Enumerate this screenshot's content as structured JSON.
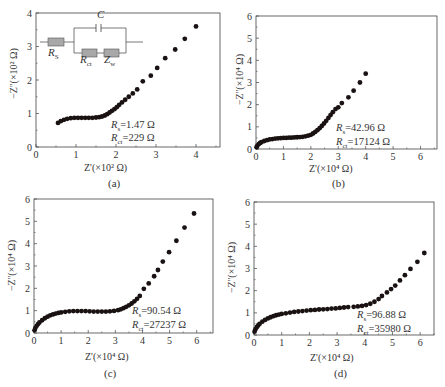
{
  "chart_data": [
    {
      "id": "a",
      "type": "scatter",
      "caption": "(a)",
      "xlabel": "Z'(×10² Ω)",
      "ylabel": "−Z''(×10² Ω)",
      "xlim": [
        0,
        4.6
      ],
      "ylim": [
        0,
        4
      ],
      "xticks": [
        0,
        1,
        2,
        3,
        4
      ],
      "yticks": [
        0,
        1,
        2,
        3,
        4
      ],
      "annotations": [
        "Rs=1.47 Ω",
        "Rct=229 Ω"
      ],
      "inset": {
        "type": "equivalent-circuit",
        "labels": [
          "C",
          "RS",
          "Rct",
          "Zw"
        ]
      },
      "x": [
        0.55,
        0.62,
        0.7,
        0.78,
        0.87,
        0.96,
        1.05,
        1.14,
        1.23,
        1.32,
        1.41,
        1.5,
        1.58,
        1.65,
        1.72,
        1.78,
        1.84,
        1.9,
        1.96,
        2.02,
        2.08,
        2.15,
        2.23,
        2.32,
        2.42,
        2.53,
        2.67,
        2.87,
        3.03,
        3.23,
        3.48,
        3.72,
        4.0,
        4.33
      ],
      "y": [
        0.72,
        0.77,
        0.81,
        0.84,
        0.86,
        0.87,
        0.87,
        0.87,
        0.87,
        0.87,
        0.87,
        0.88,
        0.89,
        0.91,
        0.94,
        0.98,
        1.03,
        1.08,
        1.13,
        1.19,
        1.26,
        1.33,
        1.41,
        1.5,
        1.6,
        1.72,
        1.96,
        2.13,
        2.36,
        2.65,
        2.91,
        3.23,
        3.6
      ]
    },
    {
      "id": "b",
      "type": "scatter",
      "caption": "(b)",
      "xlabel": "Z'(×10⁴ Ω)",
      "ylabel": "−Z''(×10⁴ Ω)",
      "xlim": [
        0,
        6.6
      ],
      "ylim": [
        0,
        6
      ],
      "xticks": [
        0,
        1,
        2,
        3,
        4,
        5,
        6
      ],
      "yticks": [
        0,
        1,
        2,
        3,
        4,
        5,
        6
      ],
      "annotations": [
        "Rs=42.96 Ω",
        "Rct=17124 Ω"
      ],
      "x": [
        0.02,
        0.05,
        0.1,
        0.15,
        0.2,
        0.3,
        0.4,
        0.5,
        0.6,
        0.7,
        0.8,
        0.9,
        1.0,
        1.1,
        1.2,
        1.3,
        1.4,
        1.5,
        1.6,
        1.7,
        1.8,
        1.9,
        2.0,
        2.08,
        2.16,
        2.24,
        2.32,
        2.4,
        2.48,
        2.56,
        2.64,
        2.72,
        2.8,
        2.9,
        3.0,
        3.13,
        3.37,
        3.56,
        3.79,
        4.0
      ],
      "y": [
        0.08,
        0.15,
        0.22,
        0.27,
        0.31,
        0.36,
        0.4,
        0.43,
        0.45,
        0.47,
        0.48,
        0.49,
        0.5,
        0.5,
        0.51,
        0.51,
        0.52,
        0.53,
        0.54,
        0.55,
        0.57,
        0.6,
        0.64,
        0.7,
        0.77,
        0.85,
        0.94,
        1.04,
        1.15,
        1.27,
        1.4,
        1.53,
        1.66,
        1.8,
        1.88,
        2.07,
        2.33,
        2.63,
        3.0,
        3.4
      ]
    },
    {
      "id": "c",
      "type": "scatter",
      "caption": "(c)",
      "xlabel": "Z'(×10⁴ Ω)",
      "ylabel": "−Z''(×10⁴ Ω)",
      "xlim": [
        0,
        6.6
      ],
      "ylim": [
        0,
        6
      ],
      "xticks": [
        0,
        1,
        2,
        3,
        4,
        5,
        6
      ],
      "yticks": [
        0,
        1,
        2,
        3,
        4,
        5,
        6
      ],
      "annotations": [
        "Rs=90.54 Ω",
        "Rct=27237 Ω"
      ],
      "x": [
        0.02,
        0.05,
        0.1,
        0.15,
        0.2,
        0.3,
        0.4,
        0.5,
        0.6,
        0.7,
        0.8,
        0.9,
        1.0,
        1.15,
        1.3,
        1.45,
        1.6,
        1.75,
        1.9,
        2.05,
        2.2,
        2.35,
        2.5,
        2.65,
        2.8,
        2.95,
        3.1,
        3.2,
        3.3,
        3.4,
        3.5,
        3.6,
        3.7,
        3.8,
        3.9,
        4.05,
        4.23,
        4.43,
        4.57,
        4.75,
        4.98,
        5.25,
        5.55,
        5.9
      ],
      "y": [
        0.12,
        0.22,
        0.32,
        0.4,
        0.47,
        0.57,
        0.66,
        0.73,
        0.79,
        0.83,
        0.87,
        0.9,
        0.92,
        0.95,
        0.97,
        0.98,
        0.98,
        0.98,
        0.98,
        0.97,
        0.96,
        0.96,
        0.96,
        0.96,
        0.97,
        0.99,
        1.02,
        1.06,
        1.11,
        1.17,
        1.24,
        1.32,
        1.42,
        1.53,
        1.66,
        1.98,
        2.22,
        2.54,
        2.82,
        3.2,
        3.62,
        4.13,
        4.72,
        5.35
      ]
    },
    {
      "id": "d",
      "type": "scatter",
      "caption": "(d)",
      "xlabel": "Z'(×10⁴ Ω)",
      "ylabel": "−Z''(×10⁴ Ω)",
      "xlim": [
        0,
        6.5
      ],
      "ylim": [
        0,
        6
      ],
      "xticks": [
        0,
        1,
        2,
        3,
        4,
        5,
        6
      ],
      "yticks": [
        0,
        1,
        2,
        3,
        4,
        5,
        6
      ],
      "annotations": [
        "Rs=96.88 Ω",
        "Rct=35980 Ω"
      ],
      "x": [
        0.02,
        0.05,
        0.1,
        0.15,
        0.2,
        0.3,
        0.4,
        0.5,
        0.6,
        0.7,
        0.8,
        0.9,
        1.0,
        1.15,
        1.3,
        1.45,
        1.6,
        1.75,
        1.9,
        2.05,
        2.2,
        2.35,
        2.5,
        2.65,
        2.8,
        2.95,
        3.1,
        3.25,
        3.4,
        3.6,
        3.75,
        3.9,
        4.05,
        4.2,
        4.35,
        4.5,
        4.62,
        4.8,
        4.95,
        5.1,
        5.27,
        5.45,
        5.65,
        5.9,
        6.15
      ],
      "y": [
        0.15,
        0.25,
        0.35,
        0.43,
        0.5,
        0.6,
        0.68,
        0.75,
        0.8,
        0.85,
        0.89,
        0.92,
        0.95,
        0.98,
        1.01,
        1.04,
        1.06,
        1.08,
        1.1,
        1.12,
        1.13,
        1.15,
        1.16,
        1.17,
        1.19,
        1.2,
        1.22,
        1.24,
        1.26,
        1.27,
        1.29,
        1.31,
        1.35,
        1.41,
        1.5,
        1.62,
        1.76,
        1.92,
        2.07,
        2.23,
        2.46,
        2.7,
        2.98,
        3.3,
        3.7
      ]
    }
  ],
  "panels": {
    "a": {
      "caption": "(a)",
      "xlabel": "Z'(×10² Ω)",
      "ylabel": "−Z''(×10² Ω)",
      "rs": "=1.47 Ω",
      "rct": "=229 Ω"
    },
    "b": {
      "caption": "(b)",
      "xlabel": "Z'(×10⁴ Ω)",
      "ylabel": "−Z''(×10⁴ Ω)",
      "rs": "=42.96 Ω",
      "rct": "=17124 Ω"
    },
    "c": {
      "caption": "(c)",
      "xlabel": "Z'(×10⁴ Ω)",
      "ylabel": "−Z''(×10⁴ Ω)",
      "rs": "=90.54 Ω",
      "rct": "=27237 Ω"
    },
    "d": {
      "caption": "(d)",
      "xlabel": "Z'(×10⁴ Ω)",
      "ylabel": "−Z''(×10⁴ Ω)",
      "rs": "=96.88 Ω",
      "rct": "=35980 Ω"
    }
  },
  "circuit": {
    "c_label": "C",
    "rs_label": "R",
    "rs_sub": "S",
    "rct_label": "R",
    "rct_sub": "ct",
    "zw_label": "Z",
    "zw_sub": "w"
  },
  "style": {
    "marker_color": "#1a1212",
    "axis_color": "#444444",
    "resistor_fill": "#a8a8a8"
  }
}
